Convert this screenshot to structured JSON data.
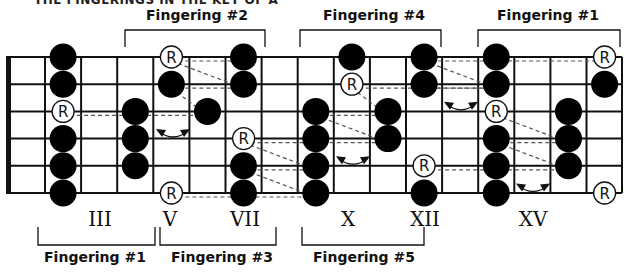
{
  "title": "THE FINGERINGS IN THE KEY OF A",
  "fretboard": {
    "strings": 6,
    "frets_shown": 17,
    "nut_x": 10,
    "right_x": 622,
    "top_y": 57,
    "string_spacing": 27.2,
    "fret_spacing": 36.1,
    "colors": {
      "line": "#111111",
      "dot": "#000000",
      "root_fill": "#ffffff",
      "dashed": "#555555"
    }
  },
  "top_fingerings": [
    {
      "label": "Fingering #2",
      "x1": 125,
      "x2": 265,
      "label_x": 197
    },
    {
      "label": "Fingering #4",
      "x1": 300,
      "x2": 441,
      "label_x": 374
    },
    {
      "label": "Fingering #1",
      "x1": 478,
      "x2": 620,
      "label_x": 548
    }
  ],
  "bottom_fingerings": [
    {
      "label": "Fingering #1",
      "x1": 38,
      "x2": 155,
      "label_x": 95
    },
    {
      "label": "Fingering #3",
      "x1": 160,
      "x2": 276,
      "label_x": 222
    },
    {
      "label": "Fingering #5",
      "x1": 302,
      "x2": 424,
      "label_x": 364
    }
  ],
  "fret_markers": [
    {
      "label": "III",
      "x": 100
    },
    {
      "label": "V",
      "x": 170
    },
    {
      "label": "VII",
      "x": 245
    },
    {
      "label": "X",
      "x": 348
    },
    {
      "label": "XII",
      "x": 425
    },
    {
      "label": "XV",
      "x": 533
    }
  ],
  "notes": [
    {
      "string": 1,
      "fret": 2,
      "root": false
    },
    {
      "string": 1,
      "fret": 5,
      "root": true
    },
    {
      "string": 1,
      "fret": 7,
      "root": false
    },
    {
      "string": 1,
      "fret": 10,
      "root": false
    },
    {
      "string": 1,
      "fret": 12,
      "root": false
    },
    {
      "string": 1,
      "fret": 14,
      "root": false
    },
    {
      "string": 1,
      "fret": 17,
      "root": true
    },
    {
      "string": 2,
      "fret": 2,
      "root": false
    },
    {
      "string": 2,
      "fret": 5,
      "root": false
    },
    {
      "string": 2,
      "fret": 7,
      "root": false
    },
    {
      "string": 2,
      "fret": 10,
      "root": true
    },
    {
      "string": 2,
      "fret": 12,
      "root": false
    },
    {
      "string": 2,
      "fret": 14,
      "root": false
    },
    {
      "string": 2,
      "fret": 17,
      "root": false
    },
    {
      "string": 3,
      "fret": 2,
      "root": true
    },
    {
      "string": 3,
      "fret": 4,
      "root": false
    },
    {
      "string": 3,
      "fret": 6,
      "root": false
    },
    {
      "string": 3,
      "fret": 9,
      "root": false
    },
    {
      "string": 3,
      "fret": 11,
      "root": false
    },
    {
      "string": 3,
      "fret": 14,
      "root": true
    },
    {
      "string": 3,
      "fret": 16,
      "root": false
    },
    {
      "string": 4,
      "fret": 2,
      "root": false
    },
    {
      "string": 4,
      "fret": 4,
      "root": false
    },
    {
      "string": 4,
      "fret": 7,
      "root": true
    },
    {
      "string": 4,
      "fret": 9,
      "root": false
    },
    {
      "string": 4,
      "fret": 11,
      "root": false
    },
    {
      "string": 4,
      "fret": 14,
      "root": false
    },
    {
      "string": 4,
      "fret": 16,
      "root": false
    },
    {
      "string": 5,
      "fret": 2,
      "root": false
    },
    {
      "string": 5,
      "fret": 4,
      "root": false
    },
    {
      "string": 5,
      "fret": 7,
      "root": false
    },
    {
      "string": 5,
      "fret": 9,
      "root": false
    },
    {
      "string": 5,
      "fret": 12,
      "root": true
    },
    {
      "string": 5,
      "fret": 14,
      "root": false
    },
    {
      "string": 5,
      "fret": 16,
      "root": false
    },
    {
      "string": 6,
      "fret": 2,
      "root": false
    },
    {
      "string": 6,
      "fret": 5,
      "root": true
    },
    {
      "string": 6,
      "fret": 7,
      "root": false
    },
    {
      "string": 6,
      "fret": 9,
      "root": false
    },
    {
      "string": 6,
      "fret": 12,
      "root": false
    },
    {
      "string": 6,
      "fret": 14,
      "root": false
    },
    {
      "string": 6,
      "fret": 17,
      "root": true
    }
  ],
  "root_symbol": "R",
  "dashed_links": [
    {
      "from": [
        1,
        5
      ],
      "to": [
        2,
        7
      ]
    },
    {
      "from": [
        1,
        5
      ],
      "to": [
        1,
        7
      ]
    },
    {
      "from": [
        2,
        5
      ],
      "to": [
        2,
        7
      ]
    },
    {
      "from": [
        2,
        5
      ],
      "to": [
        3,
        6
      ]
    },
    {
      "from": [
        3,
        2
      ],
      "to": [
        3,
        6
      ]
    },
    {
      "from": [
        6,
        5
      ],
      "to": [
        6,
        9
      ]
    },
    {
      "from": [
        4,
        7
      ],
      "to": [
        4,
        9
      ]
    },
    {
      "from": [
        4,
        7
      ],
      "to": [
        5,
        9
      ]
    },
    {
      "from": [
        5,
        7
      ],
      "to": [
        5,
        9
      ]
    },
    {
      "from": [
        5,
        7
      ],
      "to": [
        6,
        9
      ]
    },
    {
      "from": [
        2,
        10
      ],
      "to": [
        2,
        14
      ]
    },
    {
      "from": [
        2,
        10
      ],
      "to": [
        3,
        11
      ]
    },
    {
      "from": [
        3,
        9
      ],
      "to": [
        3,
        11
      ]
    },
    {
      "from": [
        3,
        9
      ],
      "to": [
        4,
        11
      ]
    },
    {
      "from": [
        4,
        9
      ],
      "to": [
        4,
        11
      ]
    },
    {
      "from": [
        1,
        12
      ],
      "to": [
        1,
        17
      ]
    },
    {
      "from": [
        1,
        12
      ],
      "to": [
        2,
        14
      ]
    },
    {
      "from": [
        2,
        12
      ],
      "to": [
        2,
        14
      ]
    },
    {
      "from": [
        5,
        12
      ],
      "to": [
        5,
        16
      ]
    },
    {
      "from": [
        3,
        14
      ],
      "to": [
        4,
        16
      ]
    },
    {
      "from": [
        4,
        14
      ],
      "to": [
        4,
        16
      ]
    },
    {
      "from": [
        4,
        14
      ],
      "to": [
        5,
        16
      ]
    }
  ],
  "shift_arrows": [
    {
      "string_gap": 3.5,
      "x1": 155,
      "x2": 191
    },
    {
      "string_gap": 4.5,
      "x1": 335,
      "x2": 371
    },
    {
      "string_gap": 2.5,
      "x1": 443,
      "x2": 479
    },
    {
      "string_gap": 5.5,
      "x1": 515,
      "x2": 551
    }
  ]
}
